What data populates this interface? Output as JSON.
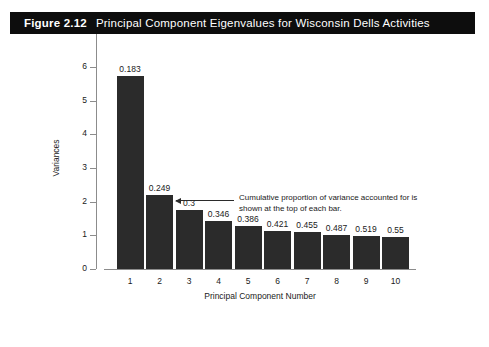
{
  "caption": {
    "figure_number": "Figure 2.12",
    "title": "Principal Component Eigenvalues for Wisconsin Dells Activities"
  },
  "annotation": {
    "text": "Cumulative proportion of variance accounted for is shown at the top of each bar."
  },
  "chart_data": {
    "type": "bar",
    "title": "Principal Component Eigenvalues for Wisconsin Dells Activities",
    "xlabel": "Principal Component Number",
    "ylabel": "Variances",
    "categories": [
      "1",
      "2",
      "3",
      "4",
      "5",
      "6",
      "7",
      "8",
      "9",
      "10"
    ],
    "values": [
      5.72,
      2.19,
      1.75,
      1.44,
      1.28,
      1.12,
      1.09,
      1.02,
      0.99,
      0.95
    ],
    "data_labels": [
      "0.183",
      "0.249",
      "0.3",
      "0.346",
      "0.386",
      "0.421",
      "0.455",
      "0.487",
      "0.519",
      "0.55"
    ],
    "ylim": [
      0,
      6
    ],
    "yticks": [
      0,
      1,
      2,
      3,
      4,
      5,
      6
    ],
    "ytick_labels": [
      "0",
      "1",
      "2",
      "3",
      "4",
      "5",
      "6"
    ],
    "grid": false,
    "legend": null,
    "bar_color": "#2b2b2b",
    "axis_color": "#8c8c8c"
  }
}
